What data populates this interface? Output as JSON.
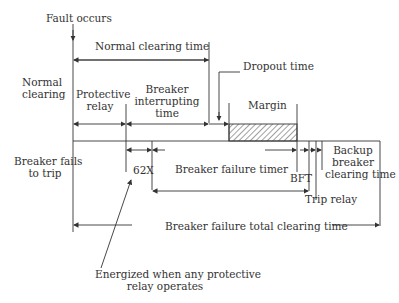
{
  "diagram": {
    "labels": {
      "fault_occurs": "Fault occurs",
      "normal_clearing_time": "Normal clearing time",
      "normal_clearing_l1": "Normal",
      "normal_clearing_l2": "clearing",
      "protective_relay_l1": "Protective",
      "protective_relay_l2": "relay",
      "breaker_interrupting_l1": "Breaker",
      "breaker_interrupting_l2": "interrupting",
      "breaker_interrupting_l3": "time",
      "dropout_time": "Dropout time",
      "margin": "Margin",
      "breaker_fails_l1": "Breaker fails",
      "breaker_fails_l2": "to trip",
      "x62": "62X",
      "breaker_failure_timer": "Breaker failure timer",
      "bft": "BFT",
      "backup_l1": "Backup",
      "backup_l2": "breaker",
      "backup_l3": "clearing time",
      "trip_relay": "Trip relay",
      "total_clearing": "Breaker failure total clearing time",
      "energized_l1": "Energized when any protective",
      "energized_l2": "relay operates"
    },
    "colors": {
      "line": "#333333",
      "hatch": "#444444"
    }
  }
}
